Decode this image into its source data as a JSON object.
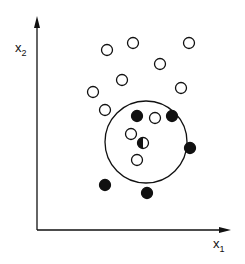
{
  "axes": {
    "x_label": "x",
    "x_sub": "1",
    "y_label": "x",
    "y_sub": "2"
  },
  "colors": {
    "ink": "#111111",
    "background": "#ffffff"
  },
  "decision_region": {
    "cx": 146,
    "cy": 142,
    "r": 41
  },
  "points": {
    "hollow": [
      [
        107,
        50
      ],
      [
        133,
        43
      ],
      [
        189,
        43
      ],
      [
        160,
        64
      ],
      [
        122,
        80
      ],
      [
        93,
        92
      ],
      [
        181,
        88
      ],
      [
        105,
        110
      ],
      [
        155,
        118
      ],
      [
        131,
        134
      ],
      [
        137,
        160
      ]
    ],
    "filled": [
      [
        137,
        116
      ],
      [
        172,
        116
      ],
      [
        190,
        148
      ],
      [
        105,
        185
      ],
      [
        147,
        193
      ]
    ],
    "query": [
      143,
      143
    ]
  }
}
